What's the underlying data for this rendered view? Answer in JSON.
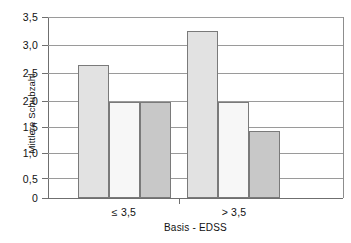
{
  "chart_data": {
    "type": "bar",
    "title": "",
    "xlabel": "Basis - EDSS",
    "ylabel": "Mittlere Schubzahl",
    "categories": [
      "≤ 3,5",
      "> 3,5"
    ],
    "ylim": [
      0,
      3.5
    ],
    "yticks": [
      "0",
      "0,5",
      "1,0",
      "1,5",
      "2,0",
      "2,5",
      "3,0",
      "3,5"
    ],
    "ytick_values": [
      0,
      0.5,
      1.0,
      1.5,
      2.0,
      2.5,
      3.0,
      3.5
    ],
    "grid": "horizontal",
    "legend": "none",
    "series": [
      {
        "name": "series-1",
        "color": "#e2e2e2",
        "values": [
          2.57,
          3.22
        ]
      },
      {
        "name": "series-2",
        "color": "#f7f7f7",
        "values": [
          1.85,
          1.86
        ]
      },
      {
        "name": "series-3",
        "color": "#c8c8c8",
        "values": [
          1.86,
          1.29
        ]
      }
    ],
    "bars": [
      {
        "group": "≤ 3,5",
        "series": "series-1",
        "value": 2.57,
        "color": "#e2e2e2"
      },
      {
        "group": "≤ 3,5",
        "series": "series-2",
        "value": 1.85,
        "color": "#f7f7f7"
      },
      {
        "group": "≤ 3,5",
        "series": "series-3",
        "value": 1.86,
        "color": "#c8c8c8"
      },
      {
        "group": "> 3,5",
        "series": "series-1",
        "value": 3.22,
        "color": "#e2e2e2"
      },
      {
        "group": "> 3,5",
        "series": "series-2",
        "value": 1.86,
        "color": "#f7f7f7"
      },
      {
        "group": "> 3,5",
        "series": "series-3",
        "value": 1.29,
        "color": "#c8c8c8"
      }
    ]
  },
  "axis": {
    "y_title": "Mittlere Schubzahl",
    "x_title": "Basis - EDSS",
    "y_labels": {
      "t0": "0",
      "t1": "0,5",
      "t2": "1,0",
      "t3": "1,5",
      "t4": "2,0",
      "t5": "2,5",
      "t6": "3,0",
      "t7": "3,5"
    },
    "x_labels": {
      "g0": "≤ 3,5",
      "g1": "> 3,5"
    }
  },
  "colors": {
    "series1": "#e2e2e2",
    "series2": "#f7f7f7",
    "series3": "#c8c8c8",
    "axis": "#6f6f6f",
    "grid": "#9a9a9a",
    "bar_outline": "#7a7a7a",
    "background": "#ffffff"
  }
}
